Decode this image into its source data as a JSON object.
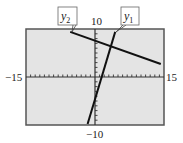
{
  "chart_data": {
    "type": "line",
    "title": "",
    "xlabel": "",
    "ylabel": "",
    "xlim": [
      -15,
      15
    ],
    "ylim": [
      -10,
      10
    ],
    "x_tick_step": 1,
    "y_tick_step": 1,
    "grid": false,
    "axis_labels": {
      "xmin": "−15",
      "xmax": "15",
      "ymax": "10",
      "ymin": "−10"
    },
    "series": [
      {
        "name": "y1",
        "label_main": "y",
        "label_sub": "1",
        "equation_estimate": "y = 3x - 5",
        "points": [
          [
            -1.6,
            -9.8
          ],
          [
            4.4,
            9.4
          ]
        ]
      },
      {
        "name": "y2",
        "label_main": "y",
        "label_sub": "2",
        "equation_estimate": "y = -x/3 + 7.6",
        "points": [
          [
            -5.4,
            9.4
          ],
          [
            14.3,
            2.7
          ]
        ]
      }
    ],
    "annotations": [
      {
        "text": "y2",
        "points_to": "y2"
      },
      {
        "text": "y1",
        "points_to": "y1"
      }
    ],
    "intersection_estimate": [
      3.8,
      6.4
    ]
  },
  "colors": {
    "screen_bg": "#e4e4e4",
    "frame": "#555555",
    "line": "#111111",
    "axis": "#333333"
  }
}
